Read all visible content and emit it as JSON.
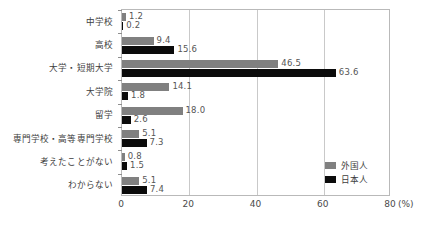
{
  "chart_data": {
    "type": "bar",
    "orientation": "horizontal",
    "title": "",
    "xlabel": "(%)",
    "ylabel": "",
    "xlim": [
      0,
      80
    ],
    "xticks": [
      0,
      20,
      40,
      60,
      80
    ],
    "grid": true,
    "legend_position": "inside-bottom-right",
    "categories": [
      "中学校",
      "高校",
      "大学・短期大学",
      "大学院",
      "留学",
      "専門学校・高等専門学校",
      "考えたことがない",
      "わからない"
    ],
    "series": [
      {
        "name": "外国人",
        "color": "#808080",
        "values": [
          1.2,
          9.4,
          46.5,
          14.1,
          18.0,
          5.1,
          0.8,
          5.1
        ],
        "labels": [
          "1.2",
          "9.4",
          "46.5",
          "14.1",
          "18.0",
          "5.1",
          "0.8",
          "5.1"
        ]
      },
      {
        "name": "日本人",
        "color": "#0b0b0b",
        "values": [
          0.2,
          15.6,
          63.6,
          1.8,
          2.6,
          7.3,
          1.5,
          7.4
        ],
        "labels": [
          "0.2",
          "15.6",
          "63.6",
          "1.8",
          "2.6",
          "7.3",
          "1.5",
          "7.4"
        ]
      }
    ]
  },
  "axis": {
    "unit_label": "(%)",
    "tick_labels": [
      "0",
      "20",
      "40",
      "60",
      "80"
    ]
  },
  "legend": {
    "items": [
      {
        "label": "外国人",
        "color": "#808080"
      },
      {
        "label": "日本人",
        "color": "#0b0b0b"
      }
    ]
  }
}
